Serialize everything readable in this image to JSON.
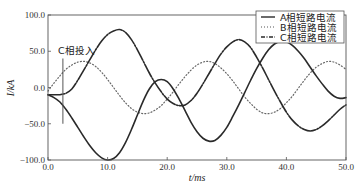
{
  "chart_data": {
    "type": "line",
    "title": "",
    "xlabel": "t/ms",
    "ylabel": "I/kA",
    "xlim": [
      0,
      50
    ],
    "ylim": [
      -100,
      100
    ],
    "xticks": [
      "0.0",
      "10.0",
      "20.0",
      "30.0",
      "40.0",
      "50.0"
    ],
    "yticks": [
      "100.0",
      "50.0",
      "0.0",
      "-50.0",
      "-100.0"
    ],
    "grid": false,
    "legend_position": "upper right",
    "annotations": [
      {
        "text": "C相投入",
        "x": 2.5,
        "line_from": -50,
        "line_to": 40
      }
    ],
    "series": [
      {
        "name": "A相短路电流",
        "style": "solid",
        "x": [
          0,
          1,
          2,
          3,
          4,
          5,
          6,
          7,
          8,
          9,
          10,
          11,
          12,
          13,
          14,
          15,
          16,
          17,
          18,
          19,
          20,
          21,
          22,
          23,
          24,
          25,
          26,
          27,
          28,
          29,
          30,
          31,
          32,
          33,
          34,
          35,
          36,
          37,
          38,
          39,
          40,
          41,
          42,
          43,
          44,
          45,
          46,
          47,
          48,
          49,
          50
        ],
        "values": [
          -10,
          -14,
          -20,
          -30,
          -42,
          -55,
          -68,
          -80,
          -90,
          -97,
          -100,
          -98,
          -90,
          -76,
          -58,
          -38,
          -18,
          -2,
          8,
          11,
          8,
          -2,
          -16,
          -32,
          -48,
          -61,
          -70,
          -74,
          -73,
          -66,
          -55,
          -40,
          -24,
          -7,
          10,
          26,
          40,
          52,
          60,
          64,
          63,
          58,
          50,
          40,
          28,
          16,
          5,
          -5,
          -12,
          -15,
          -14
        ]
      },
      {
        "name": "B相短路电流",
        "style": "dotted",
        "x": [
          0,
          1,
          2,
          3,
          4,
          5,
          6,
          7,
          8,
          9,
          10,
          11,
          12,
          13,
          14,
          15,
          16,
          17,
          18,
          19,
          20,
          21,
          22,
          23,
          24,
          25,
          26,
          27,
          28,
          29,
          30,
          31,
          32,
          33,
          34,
          35,
          36,
          37,
          38,
          39,
          40,
          41,
          42,
          43,
          44,
          45,
          46,
          47,
          48,
          49,
          50
        ],
        "values": [
          -5,
          6,
          16,
          25,
          31,
          35,
          36,
          34,
          29,
          21,
          11,
          0,
          -11,
          -21,
          -29,
          -34,
          -36,
          -35,
          -31,
          -25,
          -16,
          -6,
          5,
          15,
          24,
          31,
          35,
          36,
          33,
          27,
          19,
          9,
          -2,
          -13,
          -22,
          -30,
          -35,
          -36,
          -34,
          -29,
          -21,
          -12,
          -1,
          10,
          20,
          28,
          33,
          36,
          35,
          31,
          25
        ]
      },
      {
        "name": "C相短路电流",
        "style": "dashdot",
        "x": [
          0,
          1,
          2,
          2.5,
          3,
          4,
          5,
          6,
          7,
          8,
          9,
          10,
          11,
          12,
          13,
          14,
          15,
          16,
          17,
          18,
          19,
          20,
          21,
          22,
          23,
          24,
          25,
          26,
          27,
          28,
          29,
          30,
          31,
          32,
          33,
          34,
          35,
          36,
          37,
          38,
          39,
          40,
          41,
          42,
          43,
          44,
          45,
          46,
          47,
          48,
          49,
          50
        ],
        "values": [
          -10,
          -10,
          -10,
          -9,
          -8,
          -2,
          10,
          24,
          38,
          52,
          64,
          73,
          78,
          80,
          76,
          66,
          52,
          36,
          20,
          6,
          -6,
          -16,
          -22,
          -25,
          -24,
          -18,
          -8,
          5,
          19,
          33,
          46,
          56,
          63,
          66,
          63,
          55,
          42,
          27,
          11,
          -5,
          -20,
          -34,
          -45,
          -53,
          -58,
          -60,
          -58,
          -53,
          -46,
          -38,
          -30,
          -24
        ]
      }
    ]
  },
  "legend": {
    "items": [
      {
        "label": "A相短路电流",
        "style": "solid"
      },
      {
        "label": "B相短路电流",
        "style": "dotted"
      },
      {
        "label": "C相短路电流",
        "style": "dashdot"
      }
    ]
  },
  "axes": {
    "xlabel": "t/ms",
    "ylabel": "I/kA"
  },
  "annotation": {
    "text": "C相投入"
  },
  "colors": {
    "line": "#2a2a2a",
    "frame": "#555555"
  }
}
